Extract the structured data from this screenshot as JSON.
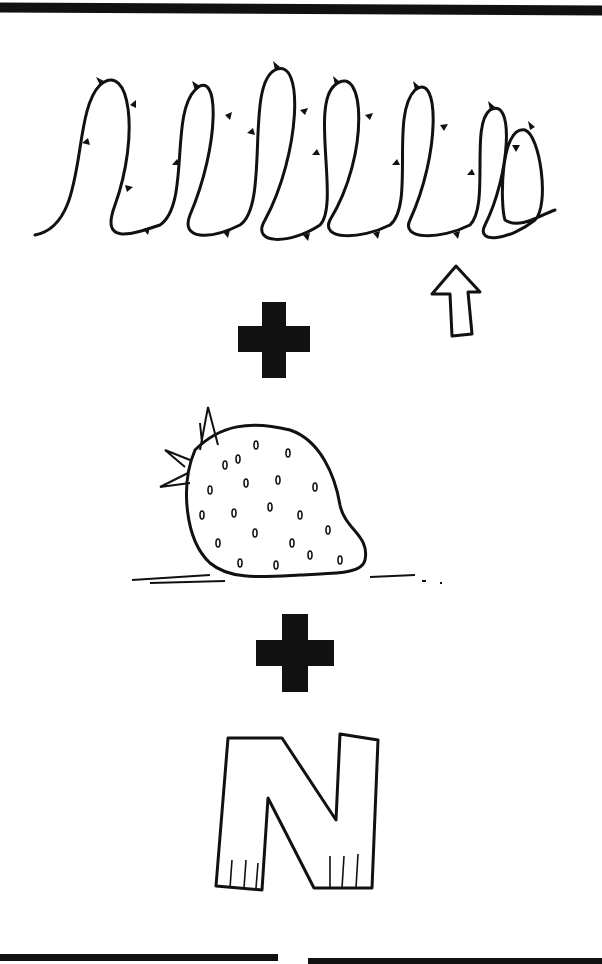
{
  "puzzle": {
    "type": "rebus",
    "elements": [
      {
        "name": "thorny-coil",
        "description": "coiled thorny vine with an arrow pointing to a thorn"
      },
      {
        "name": "plus",
        "symbol": "+"
      },
      {
        "name": "strawberry",
        "description": "strawberry resting on the ground"
      },
      {
        "name": "plus",
        "symbol": "+"
      },
      {
        "name": "letter",
        "value": "N"
      }
    ]
  },
  "colors": {
    "ink": "#111111",
    "paper": "#ffffff"
  }
}
